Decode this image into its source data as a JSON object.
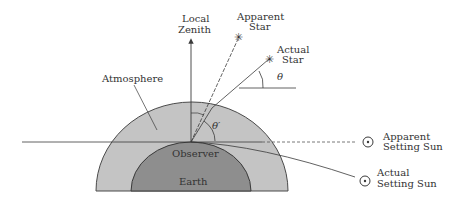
{
  "diagram": {
    "colors": {
      "background": "#ffffff",
      "atmosphere": "#c4c4c4",
      "earth": "#8e8e8e",
      "line": "#3a3a3a",
      "text": "#333333"
    },
    "labels": {
      "zenith_line1": "Local",
      "zenith_line2": "Zenith",
      "apparent_star_line1": "Apparent",
      "apparent_star_line2": "Star",
      "actual_star_line1": "Actual",
      "actual_star_line2": "Star",
      "theta": "θ",
      "theta_prime": "θ′",
      "atmosphere": "Atmosphere",
      "observer": "Observer",
      "earth": "Earth",
      "apparent_sun_line1": "Apparent",
      "apparent_sun_line2": "Setting Sun",
      "actual_sun_line1": "Actual",
      "actual_sun_line2": "Setting Sun"
    },
    "icons": {
      "star": "✳",
      "sun": "sun-symbol-circle-dot"
    }
  }
}
